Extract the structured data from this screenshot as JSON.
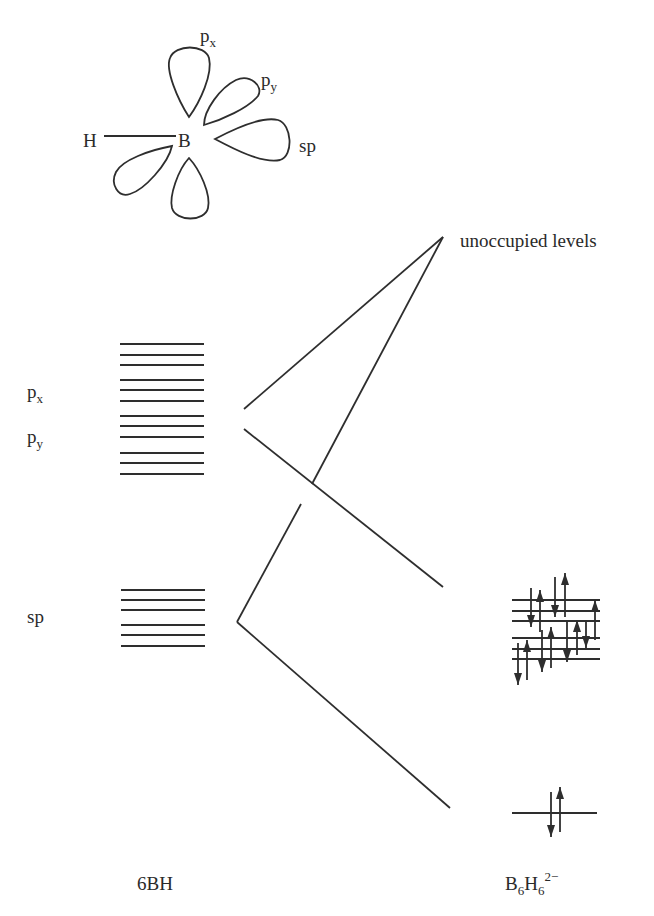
{
  "orbital_sketch": {
    "atom_h": "H",
    "atom_b": "B",
    "lobe_labels": {
      "px": {
        "base": "p",
        "sub": "x"
      },
      "py": {
        "base": "p",
        "sub": "y"
      },
      "sp": "sp"
    }
  },
  "left_labels": {
    "px": {
      "base": "p",
      "sub": "x"
    },
    "py": {
      "base": "p",
      "sub": "y"
    },
    "sp": "sp"
  },
  "right_labels": {
    "unoccupied": "unoccupied levels"
  },
  "bottom_labels": {
    "left": "6BH",
    "right": {
      "b": "B",
      "b_sub": "6",
      "h": "H",
      "h_sub": "6",
      "charge": "2−"
    }
  },
  "levels": {
    "p_levels_y": [
      344,
      355,
      365,
      380,
      390,
      401,
      416,
      426,
      437,
      453,
      463,
      474
    ],
    "sp_levels_y": [
      590,
      600,
      610,
      625,
      635,
      646
    ],
    "bonding_levels_y": [
      600,
      611,
      621,
      638,
      649,
      659
    ],
    "lowest_level_y": 813
  },
  "colors": {
    "ink": "#2e2e2e",
    "background": "#ffffff"
  }
}
